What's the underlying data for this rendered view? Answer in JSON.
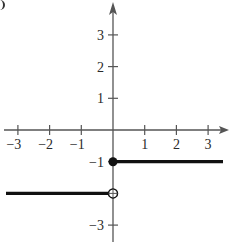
{
  "chart_data": {
    "type": "line",
    "title": "",
    "xlabel": "",
    "ylabel": "",
    "xlim": [
      -3.5,
      3.6
    ],
    "ylim": [
      -3.5,
      3.8
    ],
    "grid": false,
    "x_ticks": [
      -3,
      -2,
      -1,
      1,
      2,
      3
    ],
    "y_ticks": [
      3,
      2,
      1,
      -1,
      -3
    ],
    "x_tick_labels": [
      "−3",
      "−2",
      "−1",
      "1",
      "2",
      "3"
    ],
    "y_tick_labels": [
      "3",
      "2",
      "1",
      "−1",
      "−3"
    ],
    "series": [
      {
        "name": "segment-left",
        "x": [
          -3.5,
          0
        ],
        "y": [
          -2,
          -2
        ],
        "right_endpoint": "open"
      },
      {
        "name": "segment-right",
        "x": [
          0,
          3.5
        ],
        "y": [
          -1,
          -1
        ],
        "left_endpoint": "closed"
      }
    ],
    "points": [
      {
        "x": 0,
        "y": -1,
        "style": "closed"
      },
      {
        "x": 0,
        "y": -2,
        "style": "open"
      }
    ],
    "colors": {
      "axis": "#555555",
      "line": "#111111",
      "text": "#2a2a2a"
    }
  }
}
